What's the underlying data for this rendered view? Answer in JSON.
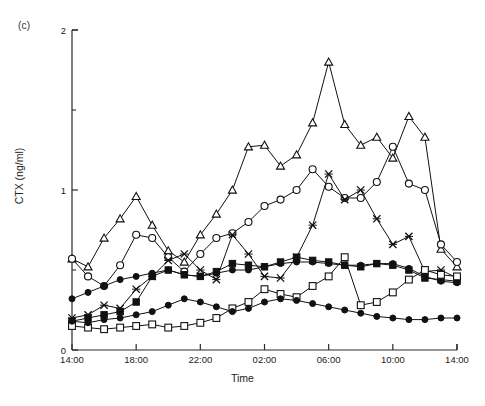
{
  "panel": {
    "label": "(c)"
  },
  "chart_data": {
    "type": "line",
    "title": "(c)",
    "xlabel": "Time",
    "ylabel": "CTX (ng/ml)",
    "xlim": [
      0,
      24
    ],
    "ylim": [
      0,
      2
    ],
    "ygrid": false,
    "xgrid": false,
    "legend_position": "none",
    "x_tick_values": [
      0,
      4,
      8,
      12,
      16,
      20,
      24
    ],
    "x_tick_labels": [
      "14:00",
      "18:00",
      "22:00",
      "02:00",
      "06:00",
      "10:00",
      "14:00"
    ],
    "y_tick_values": [
      0,
      1,
      2
    ],
    "y_tick_labels": [
      "0",
      "1",
      "2"
    ],
    "y_minor_tick_values": [
      0.5,
      1.5
    ],
    "x_hours_from_start": [
      0,
      1,
      2,
      3,
      4,
      5,
      6,
      7,
      8,
      9,
      10,
      11,
      12,
      13,
      14,
      15,
      16,
      17,
      18,
      19,
      20,
      21,
      22,
      23,
      24
    ],
    "series": [
      {
        "name": "subject-1",
        "marker": "open-triangle",
        "values": [
          0.57,
          0.52,
          0.7,
          0.82,
          0.96,
          0.78,
          0.62,
          0.55,
          0.72,
          0.85,
          1.0,
          1.27,
          1.28,
          1.15,
          1.22,
          1.42,
          1.8,
          1.41,
          1.28,
          1.33,
          1.2,
          1.46,
          1.33,
          0.63,
          0.52
        ]
      },
      {
        "name": "subject-2",
        "marker": "open-circle",
        "values": [
          0.57,
          0.46,
          0.4,
          0.53,
          0.72,
          0.7,
          0.58,
          0.49,
          0.6,
          0.7,
          0.73,
          0.8,
          0.9,
          0.94,
          1.0,
          1.13,
          1.02,
          0.95,
          0.95,
          1.05,
          1.27,
          1.04,
          1.0,
          0.66,
          0.55
        ]
      },
      {
        "name": "subject-3",
        "marker": "x-cross",
        "values": [
          0.2,
          0.22,
          0.28,
          0.26,
          0.38,
          0.46,
          0.56,
          0.6,
          0.5,
          0.44,
          0.72,
          0.6,
          0.46,
          0.45,
          0.58,
          0.78,
          1.1,
          0.94,
          1.0,
          0.82,
          0.66,
          0.71,
          0.49,
          0.5,
          0.45
        ]
      },
      {
        "name": "subject-4",
        "marker": "filled-circle-upper",
        "values": [
          0.32,
          0.36,
          0.4,
          0.44,
          0.46,
          0.48,
          0.5,
          0.47,
          0.46,
          0.48,
          0.5,
          0.5,
          0.52,
          0.54,
          0.55,
          0.55,
          0.54,
          0.53,
          0.53,
          0.54,
          0.54,
          0.51,
          0.46,
          0.43,
          0.42
        ]
      },
      {
        "name": "subject-5",
        "marker": "filled-square",
        "values": [
          0.18,
          0.2,
          0.22,
          0.24,
          0.3,
          0.46,
          0.5,
          0.47,
          0.46,
          0.49,
          0.54,
          0.53,
          0.52,
          0.55,
          0.58,
          0.56,
          0.55,
          0.53,
          0.52,
          0.54,
          0.53,
          0.5,
          0.45,
          0.44,
          0.43
        ]
      },
      {
        "name": "subject-6",
        "marker": "open-square",
        "values": [
          0.15,
          0.14,
          0.13,
          0.14,
          0.15,
          0.16,
          0.14,
          0.15,
          0.17,
          0.2,
          0.26,
          0.3,
          0.38,
          0.35,
          0.33,
          0.4,
          0.46,
          0.58,
          0.28,
          0.3,
          0.36,
          0.44,
          0.5,
          0.47,
          0.46
        ]
      },
      {
        "name": "subject-7",
        "marker": "filled-circle-lower",
        "values": [
          0.18,
          0.17,
          0.19,
          0.2,
          0.22,
          0.24,
          0.28,
          0.32,
          0.3,
          0.27,
          0.24,
          0.26,
          0.3,
          0.32,
          0.31,
          0.29,
          0.27,
          0.25,
          0.23,
          0.21,
          0.2,
          0.19,
          0.19,
          0.2,
          0.2
        ]
      }
    ]
  }
}
